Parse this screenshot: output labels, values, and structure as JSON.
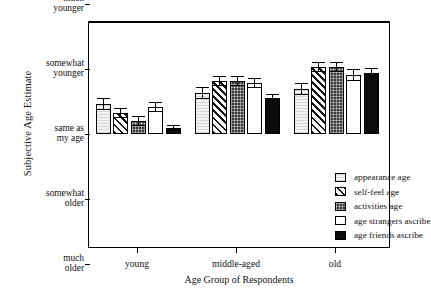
{
  "chart_data": {
    "type": "bar",
    "title": "",
    "xlabel": "Age Group of Respondents",
    "ylabel": "Subjective Age Estimate",
    "categories": [
      "young",
      "middle-aged",
      "old"
    ],
    "y_tick_labels": [
      "much\nyounger",
      "somewhat\nyounger",
      "same as\nmy age",
      "somewhat\nolder",
      "much\nolder"
    ],
    "y_tick_values": [
      2,
      1,
      0,
      -1,
      -2
    ],
    "ylim": [
      -2.2,
      2.2
    ],
    "grid": false,
    "legend_position": "inside-right",
    "baseline_label": "same as my age",
    "note": "Values are in units where 1.0 = 'somewhat younger', 0 = 'same as my age'. Positive = younger.",
    "series": [
      {
        "name": "appearance age",
        "pattern": "light-gray-fine-lines",
        "values": [
          0.46,
          0.63,
          0.69
        ],
        "errors": [
          0.09,
          0.09,
          0.09
        ]
      },
      {
        "name": "self-feel age",
        "pattern": "diagonal-hatch",
        "values": [
          0.32,
          0.82,
          1.03
        ],
        "errors": [
          0.08,
          0.08,
          0.08
        ]
      },
      {
        "name": "activities age",
        "pattern": "dark-dotted",
        "values": [
          0.2,
          0.82,
          1.03
        ],
        "errors": [
          0.07,
          0.08,
          0.08
        ]
      },
      {
        "name": "age strangers ascribe",
        "pattern": "white",
        "values": [
          0.42,
          0.78,
          0.91
        ],
        "errors": [
          0.08,
          0.08,
          0.09
        ]
      },
      {
        "name": "age friends ascribe",
        "pattern": "solid-black",
        "values": [
          0.09,
          0.55,
          0.94
        ],
        "errors": [
          0.05,
          0.07,
          0.08
        ]
      }
    ]
  },
  "axes": {
    "y_title": "Subjective Age Estimate",
    "x_title": "Age Group of Respondents"
  },
  "legend": {
    "items": [
      {
        "label": "appearance age"
      },
      {
        "label": "self-feel age"
      },
      {
        "label": "activities age"
      },
      {
        "label": "age strangers ascribe"
      },
      {
        "label": "age friends ascribe"
      }
    ]
  }
}
